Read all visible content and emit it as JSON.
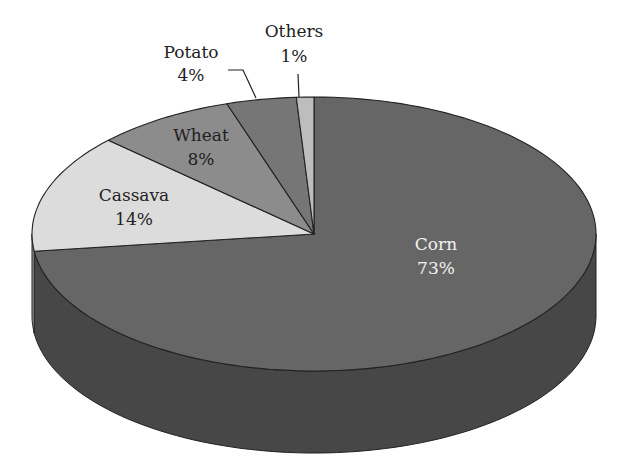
{
  "chart_data": {
    "type": "pie",
    "style": "3d",
    "title": "",
    "categories": [
      "Corn",
      "Cassava",
      "Wheat",
      "Potato",
      "Others"
    ],
    "values": [
      73,
      14,
      8,
      4,
      1
    ],
    "unit": "%",
    "labels": [
      {
        "name": "Corn",
        "pct": "73%"
      },
      {
        "name": "Cassava",
        "pct": "14%"
      },
      {
        "name": "Wheat",
        "pct": "8%"
      },
      {
        "name": "Potato",
        "pct": "4%"
      },
      {
        "name": "Others",
        "pct": "1%"
      }
    ],
    "colors": {
      "Corn": "#666666",
      "Cassava": "#dcdcdc",
      "Wheat": "#8c8c8c",
      "Potato": "#767676",
      "Others": "#bdbdbd",
      "side_Corn": "#474747",
      "side_Cassava": "#9a9a9a"
    },
    "legend": "none (labels on slices)"
  }
}
